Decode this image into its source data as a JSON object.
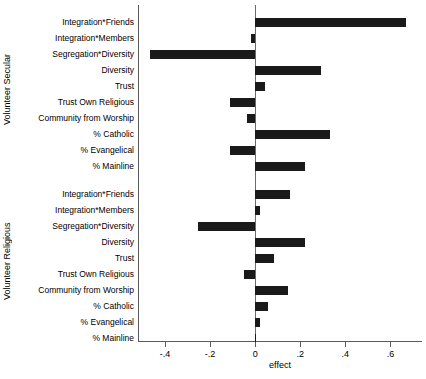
{
  "chart_data": {
    "type": "bar",
    "orientation": "horizontal",
    "title": "",
    "xlabel": "effect",
    "ylabel": "",
    "xlim": [
      -0.52,
      0.74
    ],
    "xticks": [
      -0.4,
      -0.2,
      0,
      0.2,
      0.4,
      0.6
    ],
    "xticklabels": [
      "-.4",
      "-.2",
      "0",
      ".2",
      ".4",
      ".6"
    ],
    "grid": false,
    "legend": false,
    "zero_reference_line": 0,
    "panels": [
      {
        "name": "Volunteer Secular",
        "categories": [
          "Integration*Friends",
          "Integration*Members",
          "Segregation*Diversity",
          "Diversity",
          "Trust",
          "Trust Own Religious",
          "Community from Worship",
          "% Catholic",
          "% Evangelical",
          "% Mainline"
        ],
        "values": [
          0.67,
          -0.02,
          -0.465,
          0.29,
          0.045,
          -0.11,
          -0.035,
          0.33,
          -0.11,
          0.22
        ]
      },
      {
        "name": "Volunteer Religious",
        "categories": [
          "Integration*Friends",
          "Integration*Members",
          "Segregation*Diversity",
          "Diversity",
          "Trust",
          "Trust Own Religious",
          "Community from Worship",
          "% Catholic",
          "% Evangelical",
          "% Mainline"
        ],
        "values": [
          0.155,
          0.02,
          -0.255,
          0.22,
          0.085,
          -0.05,
          0.145,
          0.055,
          0.02,
          0.005
        ]
      }
    ],
    "colors": {
      "bar": "#1a1a1a",
      "axis": "#5a5a5a",
      "zero_line": "#6b6b6b",
      "background": "#ffffff"
    }
  }
}
